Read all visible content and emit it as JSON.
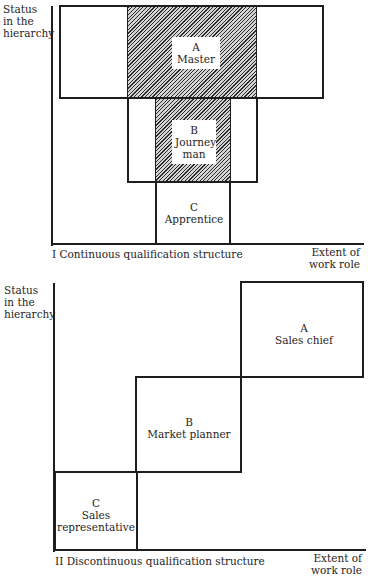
{
  "diagram_1": {
    "title": "I Continuous qualification structure",
    "y_axis_label": [
      "Status",
      "in the",
      "hierarchy"
    ],
    "x_axis_label": [
      "Extent of",
      "work role"
    ],
    "nodes": [
      {
        "letter": "A",
        "name_lines": [
          "Master"
        ],
        "hatched": true
      },
      {
        "letter": "B",
        "name_lines": [
          "Journey",
          "man"
        ],
        "hatched": true
      },
      {
        "letter": "C",
        "name_lines": [
          "Apprentice"
        ],
        "hatched": false
      }
    ]
  },
  "diagram_2": {
    "title": "II Discontinuous qualification structure",
    "y_axis_label": [
      "Status",
      "in the",
      "hierarchy"
    ],
    "x_axis_label": [
      "Extent of",
      "work role"
    ],
    "nodes": [
      {
        "letter": "A",
        "name_lines": [
          "Sales chief"
        ]
      },
      {
        "letter": "B",
        "name_lines": [
          "Market planner"
        ]
      },
      {
        "letter": "C",
        "name_lines": [
          "Sales",
          "representative"
        ]
      }
    ]
  },
  "colors": {
    "line": "#1e1e1e",
    "hatch_dark": "#2a2a2a",
    "hatch_light": "#d4d4d4",
    "background": "#ffffff"
  }
}
